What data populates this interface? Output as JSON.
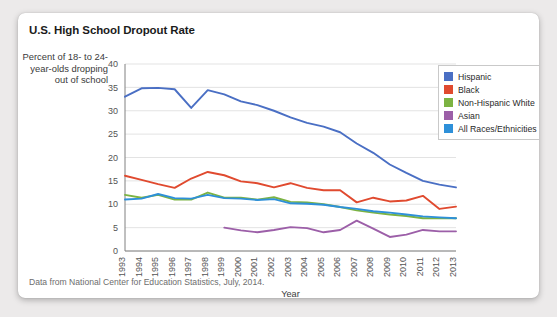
{
  "card": {
    "title": "U.S. High School Dropout Rate",
    "y_axis_caption": "Percent of 18- to 24-year-olds dropping out of school",
    "source_note": "Data from National Center for Education Statistics, July, 2014."
  },
  "colors": {
    "hispanic": "#4a6fc4",
    "black": "#e04a2f",
    "white": "#7cb342",
    "asian": "#9c5fa8",
    "all": "#2e90d9",
    "grid": "#dcdcdc",
    "axis": "#808080",
    "card_background": "#ffffff",
    "page_background": "#eceaea"
  },
  "chart_data": {
    "type": "line",
    "title": "U.S. High School Dropout Rate",
    "xlabel": "Year",
    "ylabel": "Percent of 18- to 24-year-olds dropping out of school",
    "ylim": [
      0,
      40
    ],
    "yticks": [
      0,
      5,
      10,
      15,
      20,
      25,
      30,
      35,
      40
    ],
    "grid": true,
    "legend_position": "top-right",
    "categories": [
      1993,
      1994,
      1995,
      1996,
      1997,
      1998,
      1999,
      2000,
      2001,
      2002,
      2003,
      2004,
      2005,
      2006,
      2007,
      2008,
      2009,
      2010,
      2011,
      2012,
      2013
    ],
    "x_tick_labels": [
      "1993",
      "1994",
      "1995",
      "1996",
      "1997",
      "1998",
      "1999",
      "2000",
      "2001",
      "2002",
      "2003",
      "2004",
      "2005",
      "2006",
      "2007",
      "2008",
      "2009",
      "2010",
      "2011",
      "2012",
      "2013"
    ],
    "series": [
      {
        "name": "Hispanic",
        "color": "#4a6fc4",
        "values": [
          33.0,
          34.8,
          34.9,
          34.6,
          30.6,
          34.4,
          33.5,
          32.0,
          31.2,
          30.0,
          28.6,
          27.4,
          26.6,
          25.4,
          23.0,
          21.0,
          18.5,
          16.7,
          15.0,
          14.2,
          13.6
        ]
      },
      {
        "name": "Black",
        "color": "#e04a2f",
        "values": [
          16.1,
          15.2,
          14.3,
          13.5,
          15.5,
          16.9,
          16.2,
          14.9,
          14.5,
          13.6,
          14.5,
          13.5,
          13.0,
          13.0,
          10.4,
          11.4,
          10.6,
          10.8,
          11.8,
          9.0,
          9.5
        ]
      },
      {
        "name": "Non-Hispanic White",
        "color": "#7cb342",
        "values": [
          12.0,
          11.4,
          12.0,
          11.0,
          11.0,
          12.5,
          11.4,
          11.4,
          11.0,
          11.5,
          10.5,
          10.4,
          10.0,
          9.4,
          8.7,
          8.2,
          7.8,
          7.5,
          7.0,
          7.0,
          7.0
        ]
      },
      {
        "name": "Asian",
        "color": "#9c5fa8",
        "values": [
          null,
          null,
          null,
          null,
          null,
          null,
          5.0,
          4.4,
          4.0,
          4.5,
          5.1,
          4.9,
          4.0,
          4.5,
          6.5,
          4.8,
          3.0,
          3.5,
          4.5,
          4.2,
          4.2
        ]
      },
      {
        "name": "All Races/Ethnicities",
        "color": "#2e90d9",
        "values": [
          11.0,
          11.2,
          12.2,
          11.3,
          11.2,
          12.0,
          11.3,
          11.2,
          10.9,
          11.1,
          10.2,
          10.1,
          9.9,
          9.4,
          9.0,
          8.5,
          8.2,
          7.8,
          7.4,
          7.2,
          7.0
        ]
      }
    ]
  },
  "legend": {
    "items": [
      {
        "label": "Hispanic",
        "color": "#4a6fc4"
      },
      {
        "label": "Black",
        "color": "#e04a2f"
      },
      {
        "label": "Non-Hispanic White",
        "color": "#7cb342"
      },
      {
        "label": "Asian",
        "color": "#9c5fa8"
      },
      {
        "label": "All Races/Ethnicities",
        "color": "#2e90d9"
      }
    ]
  }
}
